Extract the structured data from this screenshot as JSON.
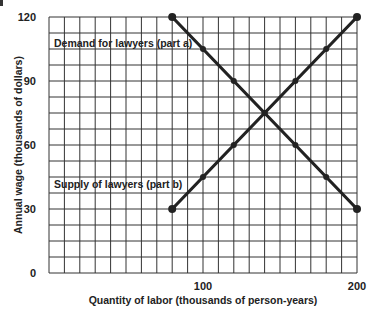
{
  "chart_data": {
    "type": "line",
    "title": "",
    "xlabel": "Quantity of labor (thousands of person-years)",
    "ylabel": "Annual wage (thousands of dollars)",
    "xlim": [
      0,
      200
    ],
    "ylim": [
      0,
      120
    ],
    "x_ticks": [
      100,
      200
    ],
    "y_ticks": [
      0,
      30,
      60,
      90,
      120
    ],
    "grid": true,
    "grid_x_step": 10,
    "grid_y_step": 7.5,
    "series": [
      {
        "name": "Demand for lawyers (part a)",
        "x": [
          80,
          100,
          120,
          140,
          160,
          180,
          200
        ],
        "y": [
          120,
          105,
          90,
          75,
          60,
          45,
          30
        ],
        "color": "#222222"
      },
      {
        "name": "Supply of lawyers (part b)",
        "x": [
          80,
          100,
          120,
          140,
          160,
          180,
          200
        ],
        "y": [
          30,
          45,
          60,
          75,
          90,
          105,
          120
        ],
        "color": "#222222"
      }
    ],
    "annotations": [
      {
        "text": "Demand for lawyers (part a)",
        "x": 2,
        "y": 105
      },
      {
        "text": "Supply of lawyers (part b)",
        "x": 2,
        "y": 37.5
      }
    ]
  },
  "labels": {
    "x_axis_title": "Quantity of labor (thousands of person-years)",
    "y_axis_title": "Annual wage (thousands of dollars)",
    "demand_label": "Demand for lawyers (part a)",
    "supply_label": "Supply of lawyers (part b)"
  }
}
